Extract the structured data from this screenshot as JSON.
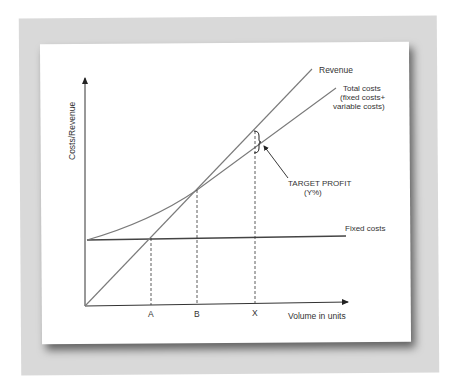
{
  "diagram": {
    "y_axis_label": "Costs/Revenue",
    "x_axis_label": "Volume in units",
    "lines": {
      "revenue": "Revenue",
      "total_costs_line1": "Total costs",
      "total_costs_line2": "(fixed costs+",
      "total_costs_line3": "variable costs)",
      "fixed_costs": "Fixed costs"
    },
    "annotation": {
      "target_profit_line1": "TARGET PROFIT",
      "target_profit_line2": "(Y%)"
    },
    "x_markers": [
      "A",
      "B",
      "X"
    ],
    "colors": {
      "line": "#7a7a7a",
      "axis": "#333333",
      "fixed_cost_line": "#444444",
      "frame": "#d9d9d9",
      "card": "#ffffff"
    }
  }
}
